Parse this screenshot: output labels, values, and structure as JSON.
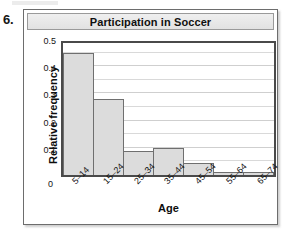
{
  "question_number": "6.",
  "chart_data": {
    "type": "bar",
    "title": "Participation in Soccer",
    "xlabel": "Age",
    "ylabel": "Relative frequency",
    "categories": [
      "5–14",
      "15–24",
      "25–34",
      "35–44",
      "45–54",
      "55–64",
      "65–74"
    ],
    "values": [
      0.45,
      0.28,
      0.09,
      0.1,
      0.045,
      0.01,
      0.01
    ],
    "ylim": [
      0,
      0.5
    ],
    "ytick_labels": [
      "0",
      "0.1",
      "0.2",
      "0.3",
      "0.4",
      "0.5"
    ],
    "ytick_values": [
      0,
      0.1,
      0.2,
      0.3,
      0.4,
      0.5
    ],
    "grid": true,
    "grid_step": 0.05,
    "legend": "none",
    "bar_fill_color": "#dcdcdc",
    "bar_border_color": "#6f6f6f",
    "title_banner_color": "#e8e8e8",
    "axis_color": "#4a4a4a"
  }
}
